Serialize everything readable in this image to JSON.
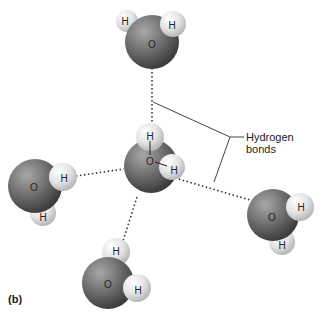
{
  "figure": {
    "panel_label": "(b)",
    "callout_label": "Hydrogen bonds",
    "atoms": {
      "oxygen": "O",
      "hydrogen": "H"
    },
    "molecules": [
      {
        "name": "top",
        "oxygen": "O",
        "hydrogens": [
          "H",
          "H"
        ]
      },
      {
        "name": "center",
        "oxygen": "O",
        "hydrogens": [
          "H",
          "H"
        ]
      },
      {
        "name": "left",
        "oxygen": "O",
        "hydrogens": [
          "H",
          "H"
        ]
      },
      {
        "name": "right",
        "oxygen": "O",
        "hydrogens": [
          "H",
          "H"
        ]
      },
      {
        "name": "bottom",
        "oxygen": "O",
        "hydrogens": [
          "H",
          "H"
        ]
      }
    ],
    "colors": {
      "oxygen": "#6b6b6b",
      "hydrogen": "#e4e4e4",
      "lines": "#444444"
    }
  }
}
